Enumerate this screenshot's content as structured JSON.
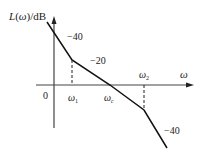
{
  "diagram": {
    "type": "bode-magnitude-asymptote",
    "y_axis_label": "L(ω)/dB",
    "x_axis_label": "ω",
    "origin_label": "0",
    "break_points": [
      {
        "label": "ω1",
        "name": "omega_1"
      },
      {
        "label": "ωc",
        "name": "omega_c"
      },
      {
        "label": "ω2",
        "name": "omega_2"
      }
    ],
    "slopes": [
      {
        "label": "−40",
        "segment": "low-frequency"
      },
      {
        "label": "−20",
        "segment": "mid-frequency"
      },
      {
        "label": "−40",
        "segment": "high-frequency"
      }
    ],
    "colors": {
      "line": "#111111",
      "axis": "#333333",
      "text": "#222222"
    }
  }
}
